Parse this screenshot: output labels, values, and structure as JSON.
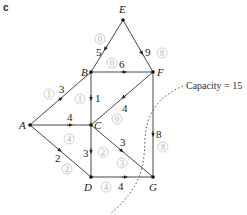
{
  "part_label": "c",
  "nodes": [
    {
      "id": "E",
      "x": 123,
      "y": 20
    },
    {
      "id": "B",
      "x": 91,
      "y": 72
    },
    {
      "id": "F",
      "x": 153,
      "y": 72
    },
    {
      "id": "A",
      "x": 30,
      "y": 125
    },
    {
      "id": "C",
      "x": 91,
      "y": 125
    },
    {
      "id": "D",
      "x": 91,
      "y": 177
    },
    {
      "id": "G",
      "x": 153,
      "y": 177
    }
  ],
  "edges": [
    {
      "from": "E",
      "to": "B",
      "capacity": "5",
      "flow": "0"
    },
    {
      "from": "E",
      "to": "F",
      "capacity": "9",
      "flow": "8"
    },
    {
      "from": "B",
      "to": "F",
      "capacity": "6",
      "flow": "0"
    },
    {
      "from": "A",
      "to": "B",
      "capacity": "3",
      "flow": "1"
    },
    {
      "from": "B",
      "to": "C",
      "capacity": "1",
      "flow": "1"
    },
    {
      "from": "F",
      "to": "C",
      "capacity": "4",
      "flow": "0"
    },
    {
      "from": "A",
      "to": "C",
      "capacity": "4",
      "flow": "4"
    },
    {
      "from": "F",
      "to": "G",
      "capacity": "8",
      "flow": "8"
    },
    {
      "from": "A",
      "to": "D",
      "capacity": "2",
      "flow": "2"
    },
    {
      "from": "C",
      "to": "D",
      "capacity": "3",
      "flow": "2"
    },
    {
      "from": "C",
      "to": "G",
      "capacity": "3",
      "flow": "3"
    },
    {
      "from": "D",
      "to": "G",
      "capacity": "4",
      "flow": "4"
    }
  ],
  "cut_label": "Capacity = 15",
  "labels": {
    "E": "E",
    "B": "B",
    "F": "F",
    "A": "A",
    "C": "C",
    "D": "D",
    "G": "G",
    "cap_EB": "5",
    "flow_EB": "0",
    "cap_EF": "9",
    "flow_EF": "8",
    "cap_BF": "6",
    "flow_BF": "0",
    "cap_AB": "3",
    "flow_AB": "1",
    "cap_BC": "1",
    "flow_BC": "1",
    "cap_FC": "4",
    "flow_FC": "0",
    "cap_AC": "4",
    "flow_AC": "4",
    "cap_FG": "8",
    "flow_FG": "8",
    "cap_AD": "2",
    "flow_AD": "2",
    "cap_CD": "3",
    "flow_CD": "2",
    "cap_CG": "3",
    "flow_CG": "3",
    "cap_DG": "4",
    "flow_DG": "4"
  }
}
